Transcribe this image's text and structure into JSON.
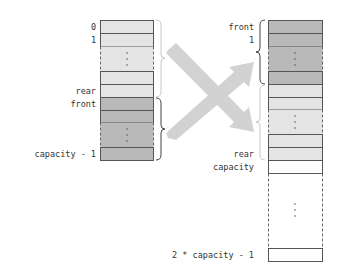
{
  "diagram": {
    "colors": {
      "light_cell": "#e4e4e4",
      "dark_cell": "#b9b9b9",
      "empty_cell": "#ffffff",
      "border": "#555555",
      "arrow": "#d2d2d2"
    },
    "left_array": {
      "labels": {
        "index0": "0",
        "index1": "1",
        "rear": "rear",
        "front": "front",
        "last": "capacity - 1"
      }
    },
    "right_array": {
      "labels": {
        "front": "front",
        "index1": "1",
        "rear": "rear",
        "capacity": "capacity",
        "last": "2 * capacity - 1"
      }
    }
  }
}
